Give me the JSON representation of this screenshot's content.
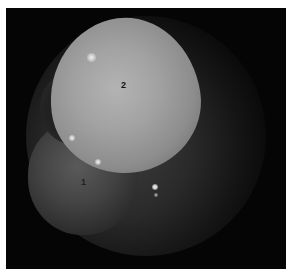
{
  "image": {
    "description": "Grayscale endoscopic view showing a large rounded bright mass with adjacent darker tissue; numbered anatomical labels",
    "labels": [
      {
        "id": "label-1",
        "text": "1"
      },
      {
        "id": "label-2",
        "text": "2"
      }
    ]
  }
}
